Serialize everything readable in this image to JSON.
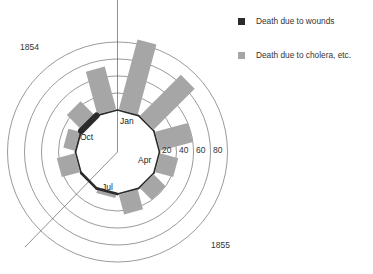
{
  "chart_data": {
    "type": "polar-bar",
    "title": "",
    "years": {
      "start_label": "1854",
      "end_label": "1855"
    },
    "months": [
      "Jan",
      "Feb",
      "Mar",
      "Apr",
      "May",
      "Jun",
      "Jul",
      "Aug",
      "Sep",
      "Oct",
      "Nov",
      "Dec"
    ],
    "labeled_months": [
      "Jan",
      "Apr",
      "Jul",
      "Oct"
    ],
    "series": [
      {
        "name": "Death due to wounds",
        "color": "#2b2b2b",
        "values": [
          1,
          1,
          1,
          1,
          1,
          1,
          3,
          3,
          1,
          2,
          7,
          1
        ]
      },
      {
        "name": "Death due to cholera, etc.",
        "color": "#a6a6a6",
        "values": [
          85,
          68,
          40,
          22,
          20,
          24,
          4,
          0,
          22,
          14,
          24,
          52
        ]
      }
    ],
    "ring_ticks": [
      20,
      40,
      60,
      80
    ],
    "rlim": [
      0,
      85
    ],
    "legend_position": "top-right",
    "grid": true
  },
  "legend": {
    "items": [
      {
        "label": "Death due to wounds",
        "color": "#2b2b2b"
      },
      {
        "label": "Death due to cholera, etc.",
        "color": "#a6a6a6"
      }
    ]
  },
  "labels": {
    "year_start": "1854",
    "year_end": "1855"
  }
}
